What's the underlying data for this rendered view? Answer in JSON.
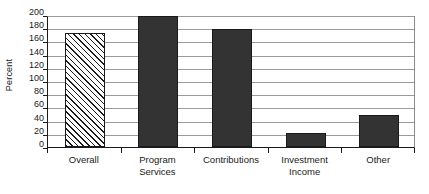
{
  "chart_data": {
    "type": "bar",
    "title": "",
    "xlabel": "",
    "ylabel": "Percent",
    "ylim": [
      0,
      200
    ],
    "yticks": [
      0,
      20,
      40,
      60,
      80,
      100,
      120,
      140,
      160,
      180,
      200
    ],
    "grid": true,
    "legend": "none",
    "categories": [
      "Overall",
      "Program Services",
      "Contributions",
      "Investment Income",
      "Other"
    ],
    "category_lines": [
      [
        "Overall",
        ""
      ],
      [
        "Program",
        "Services"
      ],
      [
        "Contributions",
        ""
      ],
      [
        "Investment",
        "Income"
      ],
      [
        "Other",
        ""
      ]
    ],
    "values": [
      172,
      199,
      179,
      21,
      48
    ],
    "bar_styles": [
      "hatched",
      "solid",
      "solid",
      "solid",
      "solid"
    ],
    "colors": {
      "solid_fill": "#333333",
      "bar_border": "#1a1a1a",
      "hatch_line": "#1a1a1a",
      "hatch_background": "#ffffff",
      "gridline": "#9a9a9a",
      "axis": "#1a1a1a",
      "text": "#1a1a1a",
      "plot_background": "#ffffff"
    }
  }
}
